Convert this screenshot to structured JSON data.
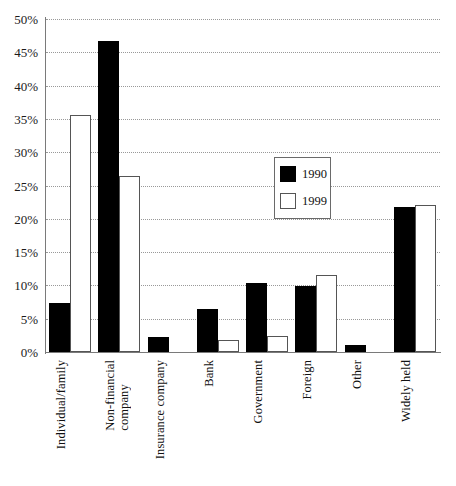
{
  "chart_data": {
    "type": "bar",
    "title": "",
    "subtitle": "",
    "xlabel": "",
    "ylabel": "",
    "ylim": [
      0,
      50
    ],
    "ytick_values": [
      0,
      5,
      10,
      15,
      20,
      25,
      30,
      35,
      40,
      45,
      50
    ],
    "ytick_labels": [
      "0%",
      "5%",
      "10%",
      "15%",
      "20%",
      "25%",
      "30%",
      "35%",
      "40%",
      "45%",
      "50%"
    ],
    "grid": true,
    "grid_axis": "y",
    "grid_style": "dotted",
    "legend_position": "inside-upper-center",
    "categories": [
      "Individual/family",
      "Non-financial\ncompany",
      "Insurance company",
      "Bank",
      "Government",
      "Foreign",
      "Other",
      "Widely held"
    ],
    "series": [
      {
        "name": "1990",
        "color": "#000000",
        "values": [
          7.3,
          46.7,
          2.2,
          6.5,
          10.3,
          9.9,
          1.1,
          21.7
        ]
      },
      {
        "name": "1999",
        "color": "#ffffff",
        "values": [
          35.6,
          26.4,
          0.0,
          1.8,
          2.4,
          11.5,
          0.0,
          22.0
        ]
      }
    ]
  },
  "legend": {
    "entries": [
      {
        "label": "1990",
        "swatch": "black-filled-square"
      },
      {
        "label": "1999",
        "swatch": "white-outlined-square"
      }
    ]
  },
  "colors": {
    "series_1990": "#000000",
    "series_1999": "#ffffff",
    "axis": "#7a7a7a",
    "gridline": "#999999",
    "text": "#111111",
    "background": "#ffffff"
  }
}
